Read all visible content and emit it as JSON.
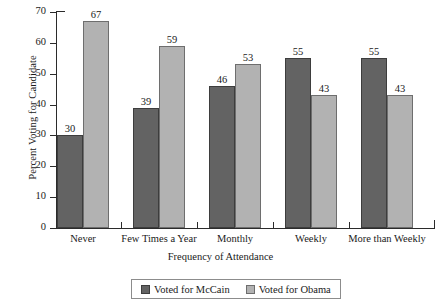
{
  "chart_data": {
    "type": "bar",
    "title": "",
    "subtitle": "",
    "xlabel": "Frequency of Attendance",
    "ylabel": "Percent Voting for Candidate",
    "categories": [
      "Never",
      "Few Times a Year",
      "Monthly",
      "Weekly",
      "More than Weekly"
    ],
    "series": [
      {
        "name": "Voted for McCain",
        "color": "#636363",
        "values": [
          30,
          39,
          46,
          55,
          55
        ]
      },
      {
        "name": "Voted for Obama",
        "color": "#b2b2b2",
        "values": [
          67,
          59,
          53,
          43,
          43
        ]
      }
    ],
    "ylim": [
      0,
      70
    ],
    "yticks": [
      0,
      10,
      20,
      30,
      40,
      50,
      60,
      70
    ],
    "ytick_labels": [
      "0",
      "10",
      "20",
      "30",
      "40",
      "50",
      "60",
      "70"
    ],
    "grid": false,
    "legend_position": "bottom",
    "data_labels": true
  },
  "axes": {
    "y_title": "Percent Voting for Candidate",
    "x_title": "Frequency of Attendance"
  },
  "legend": {
    "entries": [
      {
        "label": "Voted for McCain",
        "swatch": "mccain"
      },
      {
        "label": "Voted for Obama",
        "swatch": "obama"
      }
    ]
  }
}
